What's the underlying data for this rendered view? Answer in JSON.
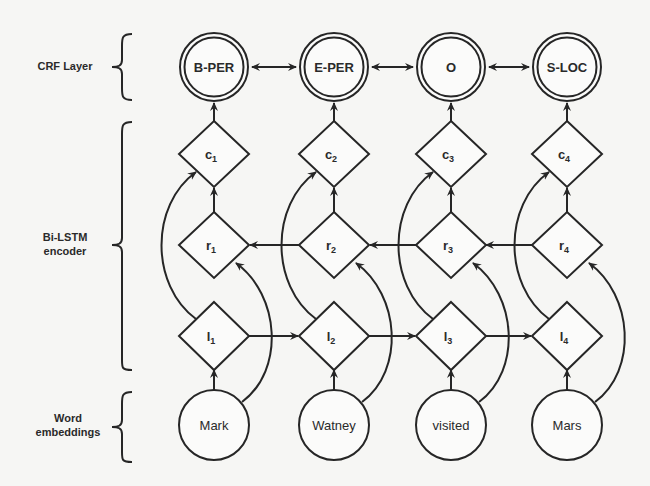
{
  "layers": {
    "crf": {
      "label": "CRF Layer"
    },
    "bilstm": {
      "label_line1": "Bi-LSTM",
      "label_line2": "encoder"
    },
    "embeddings": {
      "label_line1": "Word",
      "label_line2": "embeddings"
    }
  },
  "crf_tags": [
    {
      "label": "B-PER"
    },
    {
      "label": "E-PER"
    },
    {
      "label": "O"
    },
    {
      "label": "S-LOC"
    }
  ],
  "concat_nodes": [
    {
      "base": "c",
      "sub": "1"
    },
    {
      "base": "c",
      "sub": "2"
    },
    {
      "base": "c",
      "sub": "3"
    },
    {
      "base": "c",
      "sub": "4"
    }
  ],
  "right_nodes": [
    {
      "base": "r",
      "sub": "1"
    },
    {
      "base": "r",
      "sub": "2"
    },
    {
      "base": "r",
      "sub": "3"
    },
    {
      "base": "r",
      "sub": "4"
    }
  ],
  "left_nodes": [
    {
      "base": "l",
      "sub": "1"
    },
    {
      "base": "l",
      "sub": "2"
    },
    {
      "base": "l",
      "sub": "3"
    },
    {
      "base": "l",
      "sub": "4"
    }
  ],
  "words": [
    {
      "label": "Mark"
    },
    {
      "label": "Watney"
    },
    {
      "label": "visited"
    },
    {
      "label": "Mars"
    }
  ],
  "colors": {
    "ink": "#262626",
    "background": "#f6f6f4"
  }
}
